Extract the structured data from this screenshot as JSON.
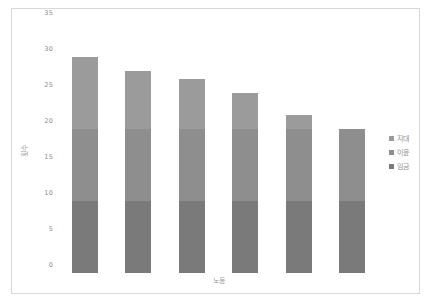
{
  "chart_data": {
    "type": "bar",
    "subtype": "stacked-bar",
    "title": "",
    "xlabel": "노동",
    "ylabel": "횟수",
    "categories": [
      "1",
      "2",
      "3",
      "4",
      "5",
      "6"
    ],
    "series": [
      {
        "name": "임금",
        "values": [
          10,
          10,
          10,
          10,
          10,
          10
        ],
        "color": "#7a7a7a"
      },
      {
        "name": "이윤",
        "values": [
          10,
          10,
          10,
          10,
          10,
          10
        ],
        "color": "#8e8e8e"
      },
      {
        "name": "지대",
        "values": [
          10,
          8,
          7,
          5,
          2,
          0
        ],
        "color": "#9b9b9b"
      }
    ],
    "totals": [
      30,
      28,
      27,
      25,
      22,
      20
    ],
    "ylim": [
      0,
      35
    ],
    "yticks": [
      0,
      5,
      10,
      15,
      20,
      25,
      30,
      35
    ],
    "ytick_labels": [
      "0",
      "5",
      "10",
      "15",
      "20",
      "25",
      "30",
      "35"
    ],
    "grid": false,
    "legend_position": "right",
    "legend_entries": [
      {
        "label": "지대",
        "color": "#9b9b9b"
      },
      {
        "label": "이윤",
        "color": "#8e8e8e"
      },
      {
        "label": "임금",
        "color": "#7a7a7a"
      }
    ],
    "colors": {
      "background": "#ffffff",
      "border": "#d8d8d8",
      "tick_text": "#8a8a8a",
      "axis_title": "#9a9a9a"
    }
  }
}
